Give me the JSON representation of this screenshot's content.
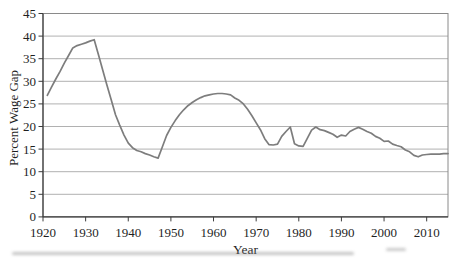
{
  "chart_data": {
    "type": "line",
    "title": "",
    "xlabel": "Year",
    "ylabel": "Percent Wage Gap",
    "xlim": [
      1920,
      2015
    ],
    "ylim": [
      0,
      45
    ],
    "x_ticks": [
      1920,
      1930,
      1940,
      1950,
      1960,
      1970,
      1980,
      1990,
      2000,
      2010
    ],
    "y_ticks": [
      0,
      5,
      10,
      15,
      20,
      25,
      30,
      35,
      40,
      45
    ],
    "grid": "horizontal gridlines at every y tick, boxed plot area",
    "legend": "none",
    "line_color": "#7d7d7d",
    "grid_color": "#a8a8a8",
    "box_color": "#8a8a8a",
    "axis_color": "#3c3c3c",
    "text_color": "#1f1f1f",
    "series": [
      {
        "name": "percent-wage-gap",
        "x": [
          1921,
          1922,
          1923,
          1924,
          1925,
          1926,
          1927,
          1928,
          1929,
          1930,
          1931,
          1932,
          1933,
          1934,
          1935,
          1936,
          1937,
          1938,
          1939,
          1940,
          1941,
          1942,
          1943,
          1944,
          1945,
          1946,
          1947,
          1948,
          1949,
          1950,
          1951,
          1952,
          1953,
          1954,
          1955,
          1956,
          1957,
          1958,
          1959,
          1960,
          1961,
          1962,
          1963,
          1964,
          1965,
          1966,
          1967,
          1968,
          1969,
          1970,
          1971,
          1972,
          1973,
          1974,
          1975,
          1976,
          1977,
          1978,
          1979,
          1980,
          1981,
          1982,
          1983,
          1984,
          1985,
          1986,
          1987,
          1988,
          1989,
          1990,
          1991,
          1992,
          1993,
          1994,
          1995,
          1996,
          1997,
          1998,
          1999,
          2000,
          2001,
          2002,
          2003,
          2004,
          2005,
          2006,
          2007,
          2008,
          2009,
          2010,
          2011,
          2012,
          2013,
          2014,
          2015
        ],
        "values": [
          26.9,
          28.7,
          30.5,
          32.2,
          34.0,
          35.7,
          37.4,
          37.9,
          38.2,
          38.5,
          38.9,
          39.2,
          35.9,
          32.5,
          29.2,
          25.9,
          22.6,
          20.3,
          18.1,
          16.3,
          15.3,
          14.7,
          14.4,
          14.0,
          13.7,
          13.3,
          13.0,
          15.5,
          18.0,
          19.8,
          21.3,
          22.6,
          23.7,
          24.6,
          25.3,
          25.9,
          26.4,
          26.8,
          27.0,
          27.2,
          27.3,
          27.3,
          27.2,
          27.0,
          26.3,
          25.8,
          25.0,
          23.8,
          22.4,
          20.8,
          19.3,
          17.3,
          16.0,
          15.9,
          16.1,
          17.8,
          18.9,
          19.9,
          16.2,
          15.7,
          15.6,
          17.4,
          19.2,
          19.9,
          19.3,
          19.1,
          18.7,
          18.3,
          17.6,
          18.1,
          17.9,
          18.9,
          19.4,
          19.8,
          19.4,
          18.9,
          18.5,
          17.8,
          17.4,
          16.7,
          16.8,
          16.1,
          15.8,
          15.5,
          14.8,
          14.4,
          13.6,
          13.3,
          13.7,
          13.8,
          13.9,
          13.9,
          13.9,
          14.0,
          14.0
        ]
      }
    ]
  }
}
